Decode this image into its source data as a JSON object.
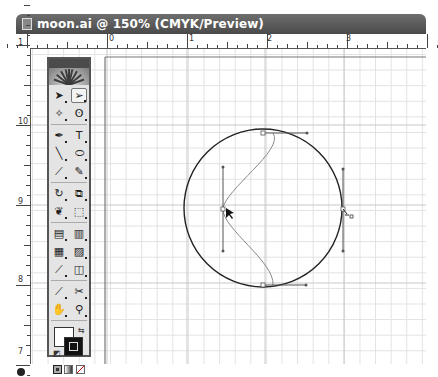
{
  "window": {
    "title": "moon.ai @ 150% (CMYK/Preview)",
    "zoom_level": "150%",
    "color_mode": "CMYK",
    "view_mode": "Preview",
    "filename": "moon.ai"
  },
  "rulers": {
    "horizontal_labels": [
      {
        "label": "0",
        "x": 107
      },
      {
        "label": "1",
        "x": 187
      },
      {
        "label": "2",
        "x": 265
      },
      {
        "label": "3",
        "x": 344
      }
    ],
    "vertical_labels": [
      {
        "label": "1",
        "y": 46
      },
      {
        "label": "10",
        "y": 125
      },
      {
        "label": "9",
        "y": 205
      },
      {
        "label": "8",
        "y": 283
      },
      {
        "label": "7",
        "y": 355
      }
    ]
  },
  "toolbox": {
    "tools": [
      [
        "selection-tool",
        "direct-selection-tool"
      ],
      [
        "magic-wand-tool",
        "lasso-tool"
      ],
      [
        "pen-tool",
        "type-tool"
      ],
      [
        "line-segment-tool",
        "ellipse-tool"
      ],
      [
        "paintbrush-tool",
        "pencil-tool"
      ],
      [
        "rotate-tool",
        "scale-tool"
      ],
      [
        "warp-tool",
        "free-transform-tool"
      ],
      [
        "symbol-sprayer-tool",
        "column-graph-tool"
      ],
      [
        "mesh-tool",
        "gradient-tool"
      ],
      [
        "eyedropper-tool",
        "blend-tool"
      ],
      [
        "slice-tool",
        "scissors-tool"
      ],
      [
        "hand-tool",
        "zoom-tool"
      ]
    ],
    "selected_tool": "direct-selection-tool",
    "glyphs": {
      "selection-tool": "➤",
      "direct-selection-tool": "➢",
      "magic-wand-tool": "✧",
      "lasso-tool": "ʘ",
      "pen-tool": "✒",
      "type-tool": "T",
      "line-segment-tool": "╲",
      "ellipse-tool": "⬭",
      "paintbrush-tool": "⟋",
      "pencil-tool": "✎",
      "rotate-tool": "↻",
      "scale-tool": "⧉",
      "warp-tool": "❦",
      "free-transform-tool": "⬚",
      "symbol-sprayer-tool": "▤",
      "column-graph-tool": "▥",
      "mesh-tool": "▦",
      "gradient-tool": "▨",
      "eyedropper-tool": "⟋",
      "blend-tool": "◫",
      "slice-tool": "⟋",
      "scissors-tool": "✂",
      "hand-tool": "✋",
      "zoom-tool": "⚲"
    },
    "fill_color": "#ffffff",
    "stroke_color": "#111111"
  },
  "artwork": {
    "circle": {
      "cx": 263,
      "cy": 208,
      "r": 79,
      "stroke": "#222222"
    },
    "anchor_points": [
      {
        "x": 263,
        "y": 133
      },
      {
        "x": 263,
        "y": 285
      },
      {
        "x": 223,
        "y": 209
      },
      {
        "x": 343,
        "y": 209
      }
    ],
    "cursor": "direct-selection-arrow",
    "accent_color": "#555555"
  }
}
